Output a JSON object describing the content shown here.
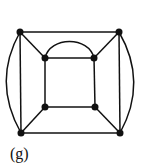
{
  "figure": {
    "label": "(g)",
    "nodes": [
      {
        "id": "outer-tl",
        "x": 20,
        "y": 32
      },
      {
        "id": "outer-tr",
        "x": 119,
        "y": 32
      },
      {
        "id": "outer-bl",
        "x": 21,
        "y": 133
      },
      {
        "id": "outer-br",
        "x": 120,
        "y": 133
      },
      {
        "id": "inner-tl",
        "x": 45,
        "y": 58
      },
      {
        "id": "inner-tr",
        "x": 94,
        "y": 58
      },
      {
        "id": "inner-bl",
        "x": 45,
        "y": 107
      },
      {
        "id": "inner-br",
        "x": 95,
        "y": 107
      }
    ],
    "edges": [
      [
        "outer-tl",
        "outer-tr"
      ],
      [
        "outer-bl",
        "outer-br"
      ],
      [
        "outer-tl",
        "outer-bl"
      ],
      [
        "outer-tr",
        "outer-br"
      ],
      [
        "outer-tl",
        "outer-bl",
        "curved-left"
      ],
      [
        "outer-tr",
        "outer-br",
        "curved-right"
      ],
      [
        "inner-tl",
        "inner-tr"
      ],
      [
        "inner-tl",
        "inner-tr",
        "curved-top"
      ],
      [
        "inner-bl",
        "inner-br"
      ],
      [
        "inner-tl",
        "inner-bl"
      ],
      [
        "inner-tr",
        "inner-br"
      ],
      [
        "outer-tl",
        "inner-tl"
      ],
      [
        "outer-tr",
        "inner-tr"
      ],
      [
        "outer-bl",
        "inner-bl"
      ],
      [
        "outer-br",
        "inner-br"
      ]
    ]
  }
}
